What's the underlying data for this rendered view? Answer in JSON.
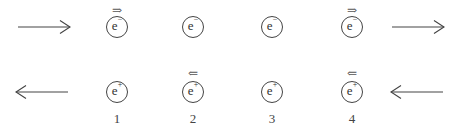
{
  "diagram": {
    "colors": {
      "stroke": "#444444",
      "text": "#333333",
      "background": "#ffffff"
    },
    "top_row": {
      "beam_direction": "right",
      "left_arrow": "long-right-arrow",
      "right_arrow": "long-right-arrow",
      "particles": [
        {
          "symbol": "e",
          "charge": "−",
          "spin_mark": "⇒"
        },
        {
          "symbol": "e",
          "charge": "−",
          "spin_mark": ""
        },
        {
          "symbol": "e",
          "charge": "−",
          "spin_mark": ""
        },
        {
          "symbol": "e",
          "charge": "−",
          "spin_mark": "⇒"
        }
      ]
    },
    "bottom_row": {
      "beam_direction": "left",
      "left_arrow": "long-left-arrow",
      "right_arrow": "long-left-arrow",
      "particles": [
        {
          "symbol": "e",
          "charge": "+",
          "spin_mark": ""
        },
        {
          "symbol": "e",
          "charge": "+",
          "spin_mark": "⇐"
        },
        {
          "symbol": "e",
          "charge": "+",
          "spin_mark": ""
        },
        {
          "symbol": "e",
          "charge": "+",
          "spin_mark": "⇐"
        }
      ]
    },
    "column_labels": [
      "1",
      "2",
      "3",
      "4"
    ]
  }
}
